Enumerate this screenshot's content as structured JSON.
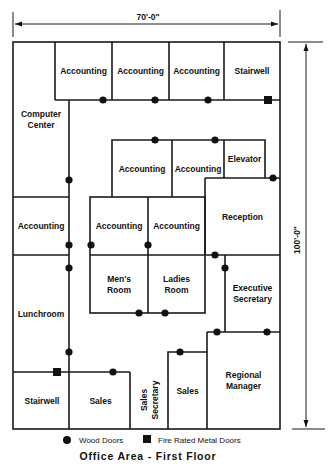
{
  "dimensions": {
    "width_label": "70'-0\"",
    "height_label": "100'-0\""
  },
  "rooms": [
    {
      "id": "acct-1",
      "label": [
        "Accounting"
      ],
      "x": 55,
      "y": 42,
      "w": 57,
      "h": 58
    },
    {
      "id": "acct-2",
      "label": [
        "Accounting"
      ],
      "x": 112,
      "y": 42,
      "w": 57,
      "h": 58
    },
    {
      "id": "acct-3",
      "label": [
        "Accounting"
      ],
      "x": 169,
      "y": 42,
      "w": 55,
      "h": 58
    },
    {
      "id": "stairwell-top",
      "label": [
        "Stairwell"
      ],
      "x": 224,
      "y": 42,
      "w": 56,
      "h": 58
    },
    {
      "id": "computer-center",
      "label": [
        "Computer",
        "Center"
      ],
      "x": 13,
      "y": 42,
      "w": 56,
      "h": 155
    },
    {
      "id": "acct-4",
      "label": [
        "Accounting"
      ],
      "x": 112,
      "y": 140,
      "w": 60,
      "h": 57
    },
    {
      "id": "acct-5",
      "label": [
        "Accounting"
      ],
      "x": 172,
      "y": 140,
      "w": 52,
      "h": 57
    },
    {
      "id": "elevator",
      "label": [
        "Elevator"
      ],
      "x": 224,
      "y": 140,
      "w": 41,
      "h": 38
    },
    {
      "id": "acct-left",
      "label": [
        "Accounting"
      ],
      "x": 13,
      "y": 197,
      "w": 56,
      "h": 58
    },
    {
      "id": "acct-6",
      "label": [
        "Accounting"
      ],
      "x": 90,
      "y": 197,
      "w": 58,
      "h": 58
    },
    {
      "id": "acct-7",
      "label": [
        "Accounting"
      ],
      "x": 148,
      "y": 197,
      "w": 57,
      "h": 58
    },
    {
      "id": "reception",
      "label": [
        "Reception"
      ],
      "x": 205,
      "y": 178,
      "w": 75,
      "h": 77
    },
    {
      "id": "mens-room",
      "label": [
        "Men's",
        "Room"
      ],
      "x": 90,
      "y": 255,
      "w": 58,
      "h": 58
    },
    {
      "id": "ladies-room",
      "label": [
        "Ladies",
        "Room"
      ],
      "x": 148,
      "y": 255,
      "w": 57,
      "h": 58
    },
    {
      "id": "executive-secretary",
      "label": [
        "Executive",
        "Secretary"
      ],
      "x": 225,
      "y": 255,
      "w": 55,
      "h": 77
    },
    {
      "id": "lunchroom",
      "label": [
        "Lunchroom"
      ],
      "x": 13,
      "y": 255,
      "w": 56,
      "h": 117
    },
    {
      "id": "regional-manager",
      "label": [
        "Regional",
        "Manager"
      ],
      "x": 207,
      "y": 332,
      "w": 73,
      "h": 97
    },
    {
      "id": "sales-right",
      "label": [
        "Sales"
      ],
      "x": 168,
      "y": 352,
      "w": 39,
      "h": 77
    },
    {
      "id": "stairwell-bottom",
      "label": [
        "Stairwell"
      ],
      "x": 13,
      "y": 372,
      "w": 58,
      "h": 57
    },
    {
      "id": "sales-left",
      "label": [
        "Sales"
      ],
      "x": 71,
      "y": 372,
      "w": 59,
      "h": 57
    }
  ],
  "open_labels": [
    {
      "id": "sales-secretary",
      "label": [
        "Sales",
        "Secretary"
      ],
      "x": 149,
      "y": 400,
      "rotate": -90
    }
  ],
  "wood_doors": [
    [
      103,
      100
    ],
    [
      155,
      100
    ],
    [
      208,
      100
    ],
    [
      69,
      180
    ],
    [
      155,
      140
    ],
    [
      215,
      140
    ],
    [
      273,
      178
    ],
    [
      69,
      245
    ],
    [
      69,
      268
    ],
    [
      91,
      245
    ],
    [
      148,
      245
    ],
    [
      215,
      255
    ],
    [
      225,
      268
    ],
    [
      139,
      313
    ],
    [
      165,
      313
    ],
    [
      69,
      352
    ],
    [
      113,
      372
    ],
    [
      217,
      332
    ],
    [
      267,
      332
    ],
    [
      180,
      352
    ]
  ],
  "metal_doors": [
    [
      268,
      100
    ],
    [
      57,
      372
    ]
  ],
  "legend": {
    "wood_label": "Wood Doors",
    "metal_label": "Fire Rated Metal Doors"
  },
  "caption": "Office Area - First Floor"
}
